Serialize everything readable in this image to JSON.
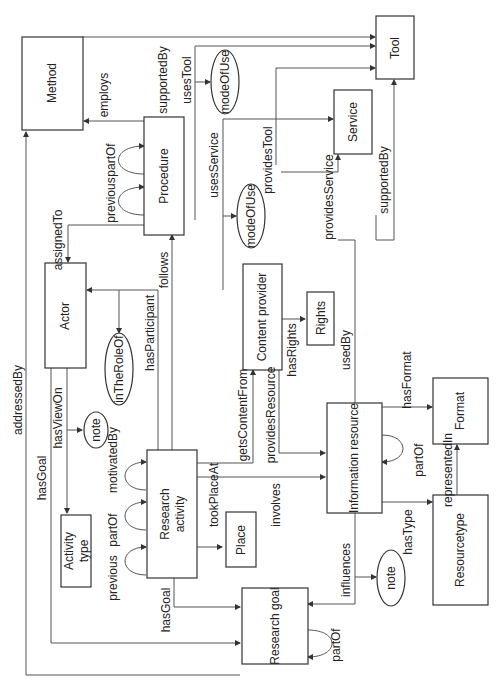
{
  "diagram": {
    "orientation": "rotated -90deg",
    "nodes": {
      "method": "Method",
      "tool": "Tool",
      "service": "Service",
      "procedure": "Procedure",
      "actor": "Actor",
      "content_provider": "Content provider",
      "rights": "Rights",
      "research_activity_1": "Research",
      "research_activity_2": "activity",
      "activity_type_1": "Activity",
      "activity_type_2": "type",
      "place": "Place",
      "information_resource": "Information resource",
      "format": "Format",
      "resourcetype": "Resourcetype",
      "research_goal": "Research goal"
    },
    "ellipses": {
      "mode_of_use_1": "modeOfUse",
      "mode_of_use_2": "modeOfUse",
      "in_the_role_of": "inTheRoleOf",
      "note_1": "note",
      "note_2": "note"
    },
    "edges": {
      "employs": "employs",
      "supported_by_1": "supportedBy",
      "uses_tool": "usesTool",
      "part_of_procedure": "partOf",
      "previous_procedure": "previous",
      "uses_service": "usesService",
      "provides_tool": "providesTool",
      "supported_by_2": "supportedBy",
      "provides_service": "providesService",
      "assigned_to": "assignedTo",
      "follows": "follows",
      "has_participant": "hasParticipant",
      "addressed_by": "addressedBy",
      "has_view_on": "hasViewOn",
      "motivated_by": "motivatedBy",
      "part_of_activity": "partOf",
      "previous_activity": "previous",
      "has_goal_1": "hasGoal",
      "has_goal_2": "hasGoal",
      "took_place_at": "tookPlaceAt",
      "gets_content_from": "getsContentFrom",
      "provides_resource": "providesResource",
      "has_rights": "hasRights",
      "used_by": "usedBy",
      "has_format": "hasFormat",
      "part_of_resource": "partOf",
      "represented_in": "representedIn",
      "has_type": "hasType",
      "involves": "involves",
      "influences": "influences",
      "part_of_goal": "partOf"
    }
  }
}
